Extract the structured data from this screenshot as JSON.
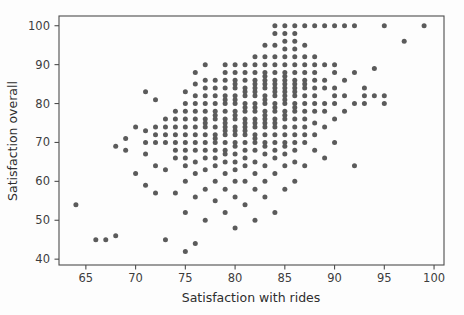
{
  "figure": {
    "background": "#fdfdfd",
    "plot_background": "#fdfdfd",
    "spine_color": "#4d4d4d",
    "marker_color": "#5b5b5b",
    "marker_size_px": 5
  },
  "chart_data": {
    "type": "scatter",
    "title": "",
    "xlabel": "Satisfaction with rides",
    "ylabel": "Satisfaction overall",
    "xlim": [
      62.3,
      101.0
    ],
    "ylim": [
      38.5,
      102.5
    ],
    "xticks": [
      65,
      70,
      75,
      80,
      85,
      90,
      95,
      100
    ],
    "yticks": [
      40,
      50,
      60,
      70,
      80,
      90,
      100
    ],
    "xtick_labels": [
      "65",
      "70",
      "75",
      "80",
      "85",
      "90",
      "95",
      "100"
    ],
    "ytick_labels": [
      "40",
      "50",
      "60",
      "70",
      "80",
      "90",
      "100"
    ],
    "grid": false,
    "legend": null,
    "marker": "circle",
    "points": [
      [
        64,
        54
      ],
      [
        66,
        45
      ],
      [
        67,
        45
      ],
      [
        68,
        46
      ],
      [
        68,
        69
      ],
      [
        69,
        68
      ],
      [
        69,
        71
      ],
      [
        70,
        62
      ],
      [
        70,
        74
      ],
      [
        71,
        59
      ],
      [
        71,
        67
      ],
      [
        71,
        70
      ],
      [
        71,
        73
      ],
      [
        71,
        83
      ],
      [
        72,
        57
      ],
      [
        72,
        64
      ],
      [
        72,
        70
      ],
      [
        72,
        72
      ],
      [
        72,
        74
      ],
      [
        72,
        81
      ],
      [
        73,
        45
      ],
      [
        73,
        63
      ],
      [
        73,
        70
      ],
      [
        73,
        72
      ],
      [
        73,
        74
      ],
      [
        73,
        76
      ],
      [
        74,
        57
      ],
      [
        74,
        66
      ],
      [
        74,
        68
      ],
      [
        74,
        70
      ],
      [
        74,
        72
      ],
      [
        74,
        74
      ],
      [
        74,
        76
      ],
      [
        74,
        78
      ],
      [
        75,
        42
      ],
      [
        75,
        52
      ],
      [
        75,
        60
      ],
      [
        75,
        64
      ],
      [
        75,
        66
      ],
      [
        75,
        68
      ],
      [
        75,
        70
      ],
      [
        75,
        72
      ],
      [
        75,
        74
      ],
      [
        75,
        76
      ],
      [
        75,
        78
      ],
      [
        75,
        80
      ],
      [
        75,
        83
      ],
      [
        76,
        44
      ],
      [
        76,
        56
      ],
      [
        76,
        62
      ],
      [
        76,
        65
      ],
      [
        76,
        68
      ],
      [
        76,
        70
      ],
      [
        76,
        72
      ],
      [
        76,
        74
      ],
      [
        76,
        76
      ],
      [
        76,
        78
      ],
      [
        76,
        80
      ],
      [
        76,
        82
      ],
      [
        76,
        85
      ],
      [
        76,
        88
      ],
      [
        77,
        50
      ],
      [
        77,
        58
      ],
      [
        77,
        63
      ],
      [
        77,
        66
      ],
      [
        77,
        68
      ],
      [
        77,
        70
      ],
      [
        77,
        72
      ],
      [
        77,
        74
      ],
      [
        77,
        75
      ],
      [
        77,
        76
      ],
      [
        77,
        78
      ],
      [
        77,
        80
      ],
      [
        77,
        82
      ],
      [
        77,
        84
      ],
      [
        77,
        86
      ],
      [
        77,
        90
      ],
      [
        78,
        55
      ],
      [
        78,
        60
      ],
      [
        78,
        64
      ],
      [
        78,
        66
      ],
      [
        78,
        68
      ],
      [
        78,
        70
      ],
      [
        78,
        71
      ],
      [
        78,
        72
      ],
      [
        78,
        74
      ],
      [
        78,
        76
      ],
      [
        78,
        77
      ],
      [
        78,
        78
      ],
      [
        78,
        80
      ],
      [
        78,
        82
      ],
      [
        78,
        84
      ],
      [
        78,
        86
      ],
      [
        79,
        52
      ],
      [
        79,
        58
      ],
      [
        79,
        62
      ],
      [
        79,
        65
      ],
      [
        79,
        67
      ],
      [
        79,
        68
      ],
      [
        79,
        70
      ],
      [
        79,
        72
      ],
      [
        79,
        73
      ],
      [
        79,
        74
      ],
      [
        79,
        75
      ],
      [
        79,
        76
      ],
      [
        79,
        78
      ],
      [
        79,
        80
      ],
      [
        79,
        81
      ],
      [
        79,
        82
      ],
      [
        79,
        84
      ],
      [
        79,
        86
      ],
      [
        79,
        88
      ],
      [
        79,
        90
      ],
      [
        80,
        48
      ],
      [
        80,
        56
      ],
      [
        80,
        60
      ],
      [
        80,
        63
      ],
      [
        80,
        65
      ],
      [
        80,
        67
      ],
      [
        80,
        69
      ],
      [
        80,
        70
      ],
      [
        80,
        72
      ],
      [
        80,
        73
      ],
      [
        80,
        74
      ],
      [
        80,
        76
      ],
      [
        80,
        77
      ],
      [
        80,
        78
      ],
      [
        80,
        80
      ],
      [
        80,
        81
      ],
      [
        80,
        82
      ],
      [
        80,
        84
      ],
      [
        80,
        85
      ],
      [
        80,
        86
      ],
      [
        80,
        88
      ],
      [
        80,
        90
      ],
      [
        81,
        54
      ],
      [
        81,
        60
      ],
      [
        81,
        64
      ],
      [
        81,
        66
      ],
      [
        81,
        68
      ],
      [
        81,
        70
      ],
      [
        81,
        72
      ],
      [
        81,
        73
      ],
      [
        81,
        74
      ],
      [
        81,
        75
      ],
      [
        81,
        76
      ],
      [
        81,
        78
      ],
      [
        81,
        79
      ],
      [
        81,
        80
      ],
      [
        81,
        82
      ],
      [
        81,
        83
      ],
      [
        81,
        84
      ],
      [
        81,
        86
      ],
      [
        81,
        88
      ],
      [
        81,
        90
      ],
      [
        82,
        50
      ],
      [
        82,
        58
      ],
      [
        82,
        62
      ],
      [
        82,
        65
      ],
      [
        82,
        68
      ],
      [
        82,
        70
      ],
      [
        82,
        71
      ],
      [
        82,
        72
      ],
      [
        82,
        74
      ],
      [
        82,
        75
      ],
      [
        82,
        76
      ],
      [
        82,
        78
      ],
      [
        82,
        79
      ],
      [
        82,
        80
      ],
      [
        82,
        82
      ],
      [
        82,
        83
      ],
      [
        82,
        84
      ],
      [
        82,
        85
      ],
      [
        82,
        86
      ],
      [
        82,
        88
      ],
      [
        82,
        90
      ],
      [
        82,
        92
      ],
      [
        83,
        56
      ],
      [
        83,
        60
      ],
      [
        83,
        64
      ],
      [
        83,
        67
      ],
      [
        83,
        69
      ],
      [
        83,
        70
      ],
      [
        83,
        72
      ],
      [
        83,
        74
      ],
      [
        83,
        75
      ],
      [
        83,
        76
      ],
      [
        83,
        77
      ],
      [
        83,
        78
      ],
      [
        83,
        80
      ],
      [
        83,
        81
      ],
      [
        83,
        82
      ],
      [
        83,
        84
      ],
      [
        83,
        85
      ],
      [
        83,
        86
      ],
      [
        83,
        87
      ],
      [
        83,
        88
      ],
      [
        83,
        90
      ],
      [
        83,
        92
      ],
      [
        83,
        95
      ],
      [
        84,
        52
      ],
      [
        84,
        62
      ],
      [
        84,
        66
      ],
      [
        84,
        68
      ],
      [
        84,
        70
      ],
      [
        84,
        72
      ],
      [
        84,
        74
      ],
      [
        84,
        75
      ],
      [
        84,
        76
      ],
      [
        84,
        78
      ],
      [
        84,
        79
      ],
      [
        84,
        80
      ],
      [
        84,
        82
      ],
      [
        84,
        83
      ],
      [
        84,
        84
      ],
      [
        84,
        85
      ],
      [
        84,
        86
      ],
      [
        84,
        88
      ],
      [
        84,
        90
      ],
      [
        84,
        92
      ],
      [
        84,
        95
      ],
      [
        84,
        98
      ],
      [
        84,
        100
      ],
      [
        85,
        58
      ],
      [
        85,
        64
      ],
      [
        85,
        67
      ],
      [
        85,
        69
      ],
      [
        85,
        70
      ],
      [
        85,
        72
      ],
      [
        85,
        74
      ],
      [
        85,
        76
      ],
      [
        85,
        77
      ],
      [
        85,
        78
      ],
      [
        85,
        80
      ],
      [
        85,
        81
      ],
      [
        85,
        82
      ],
      [
        85,
        83
      ],
      [
        85,
        84
      ],
      [
        85,
        85
      ],
      [
        85,
        86
      ],
      [
        85,
        87
      ],
      [
        85,
        88
      ],
      [
        85,
        90
      ],
      [
        85,
        92
      ],
      [
        85,
        94
      ],
      [
        85,
        96
      ],
      [
        85,
        98
      ],
      [
        85,
        100
      ],
      [
        86,
        60
      ],
      [
        86,
        65
      ],
      [
        86,
        68
      ],
      [
        86,
        70
      ],
      [
        86,
        72
      ],
      [
        86,
        74
      ],
      [
        86,
        76
      ],
      [
        86,
        78
      ],
      [
        86,
        79
      ],
      [
        86,
        80
      ],
      [
        86,
        82
      ],
      [
        86,
        83
      ],
      [
        86,
        84
      ],
      [
        86,
        85
      ],
      [
        86,
        86
      ],
      [
        86,
        88
      ],
      [
        86,
        90
      ],
      [
        86,
        92
      ],
      [
        86,
        94
      ],
      [
        86,
        96
      ],
      [
        86,
        98
      ],
      [
        86,
        100
      ],
      [
        87,
        64
      ],
      [
        87,
        70
      ],
      [
        87,
        72
      ],
      [
        87,
        74
      ],
      [
        87,
        76
      ],
      [
        87,
        78
      ],
      [
        87,
        80
      ],
      [
        87,
        82
      ],
      [
        87,
        84
      ],
      [
        87,
        85
      ],
      [
        87,
        86
      ],
      [
        87,
        88
      ],
      [
        87,
        90
      ],
      [
        87,
        92
      ],
      [
        87,
        95
      ],
      [
        87,
        100
      ],
      [
        88,
        68
      ],
      [
        88,
        72
      ],
      [
        88,
        75
      ],
      [
        88,
        78
      ],
      [
        88,
        80
      ],
      [
        88,
        82
      ],
      [
        88,
        84
      ],
      [
        88,
        86
      ],
      [
        88,
        88
      ],
      [
        88,
        90
      ],
      [
        88,
        92
      ],
      [
        88,
        100
      ],
      [
        89,
        66
      ],
      [
        89,
        74
      ],
      [
        89,
        78
      ],
      [
        89,
        80
      ],
      [
        89,
        84
      ],
      [
        89,
        86
      ],
      [
        89,
        90
      ],
      [
        89,
        100
      ],
      [
        90,
        70
      ],
      [
        90,
        76
      ],
      [
        90,
        80
      ],
      [
        90,
        82
      ],
      [
        90,
        84
      ],
      [
        90,
        88
      ],
      [
        90,
        90
      ],
      [
        90,
        100
      ],
      [
        91,
        78
      ],
      [
        91,
        82
      ],
      [
        91,
        86
      ],
      [
        91,
        100
      ],
      [
        92,
        64
      ],
      [
        92,
        80
      ],
      [
        92,
        88
      ],
      [
        92,
        100
      ],
      [
        93,
        80
      ],
      [
        93,
        82
      ],
      [
        93,
        84
      ],
      [
        94,
        82
      ],
      [
        94,
        89
      ],
      [
        95,
        80
      ],
      [
        95,
        82
      ],
      [
        95,
        100
      ],
      [
        97,
        96
      ],
      [
        99,
        100
      ]
    ]
  }
}
